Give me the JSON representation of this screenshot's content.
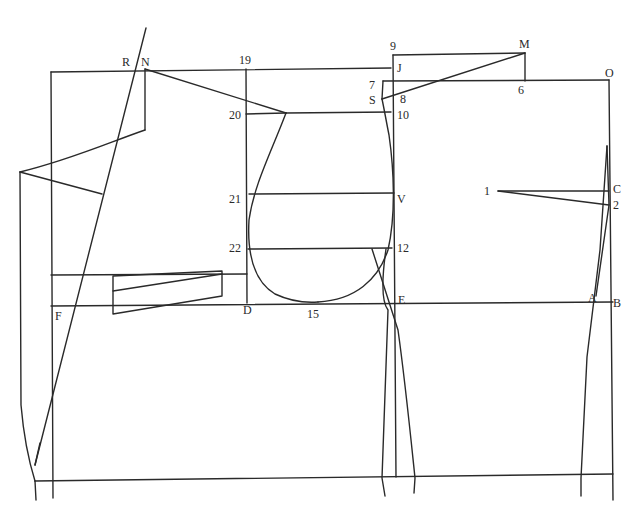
{
  "diagram": {
    "type": "garment-pattern-draft",
    "background": "#ffffff",
    "line_color": "#2a2a2a",
    "labels": [
      {
        "id": "R",
        "text": "R",
        "x": 122,
        "y": 66
      },
      {
        "id": "N",
        "text": "N",
        "x": 141,
        "y": 66
      },
      {
        "id": "19",
        "text": "19",
        "x": 239,
        "y": 64
      },
      {
        "id": "9",
        "text": "9",
        "x": 390,
        "y": 50
      },
      {
        "id": "J",
        "text": "J",
        "x": 397,
        "y": 72
      },
      {
        "id": "M",
        "text": "M",
        "x": 519,
        "y": 48
      },
      {
        "id": "O",
        "text": "O",
        "x": 605,
        "y": 77
      },
      {
        "id": "7",
        "text": "7",
        "x": 369,
        "y": 89
      },
      {
        "id": "S",
        "text": "S",
        "x": 369,
        "y": 104
      },
      {
        "id": "8",
        "text": "8",
        "x": 400,
        "y": 103
      },
      {
        "id": "6",
        "text": "6",
        "x": 518,
        "y": 94
      },
      {
        "id": "20",
        "text": "20",
        "x": 229,
        "y": 119
      },
      {
        "id": "10",
        "text": "10",
        "x": 397,
        "y": 119
      },
      {
        "id": "1",
        "text": "1",
        "x": 484,
        "y": 195
      },
      {
        "id": "C",
        "text": "C",
        "x": 613,
        "y": 193
      },
      {
        "id": "21",
        "text": "21",
        "x": 229,
        "y": 203
      },
      {
        "id": "V",
        "text": "V",
        "x": 397,
        "y": 203
      },
      {
        "id": "2",
        "text": "2",
        "x": 613,
        "y": 209
      },
      {
        "id": "22",
        "text": "22",
        "x": 229,
        "y": 252
      },
      {
        "id": "12",
        "text": "12",
        "x": 397,
        "y": 252
      },
      {
        "id": "F",
        "text": "F",
        "x": 55,
        "y": 320
      },
      {
        "id": "D",
        "text": "D",
        "x": 243,
        "y": 314
      },
      {
        "id": "15",
        "text": "15",
        "x": 307,
        "y": 318
      },
      {
        "id": "E",
        "text": "E",
        "x": 398,
        "y": 304
      },
      {
        "id": "A",
        "text": "A",
        "x": 588,
        "y": 302
      },
      {
        "id": "B",
        "text": "B",
        "x": 613,
        "y": 307
      }
    ],
    "lines": {
      "top_back_line": "M51 72 L391 68",
      "back_left_vertical": "M51 72 L53 498",
      "back_hem": "M35 481 L613 474",
      "chest_line_left": "M51 275 L247 274",
      "waist_line": "M51 306 L613 302",
      "line_19_D": "M246 69 L247 303",
      "line_20": "M246 114 L286 113",
      "line_20_10": "M286 113 L391 112",
      "line_21_V": "M249 194 L394 193",
      "line_22_12": "M248 249 L392 248",
      "center_front_vertical": "M393 55 L396 477",
      "top_9_M": "M393 55 L525 53",
      "line_7_O": "M383 81 L609 80",
      "line_M_6": "M525 53 L525 81",
      "line_M_S": "M525 53 L382 99",
      "line_7_S": "M383 81 L382 99",
      "right_vertical_O_B": "M609 80 L613 500",
      "dart_1_C": "M498 191 L609 191",
      "dart_1_2": "M498 191 L609 205",
      "lapel_N_20": "M145 69 L286 113",
      "collar_N_down": "M145 69 L145 130",
      "collar_to_left": "M145 130 C110 142, 70 160, 20 172",
      "collar_diag": "M20 172 L102 194",
      "front_left_edge": "M20 172 L21 405 C24 440, 30 465, 35 481",
      "stand_line": "M146 28 L35 465",
      "stand_line_low": "M35 481 L36 500",
      "stand_tick": "M35 465 L40 443",
      "pocket_outer": "M113 276 L113 314 L222 296 L222 271 Z",
      "pocket_inner": "M113 291 L222 274",
      "armhole_back": "M286 113 C270 155, 254 185, 249 220 C247 255, 255 282, 275 294 C290 301, 305 303, 318 302",
      "armhole_front": "M318 302 C355 300, 378 280, 388 250 C396 215, 394 170, 389 135 C386 120, 384 108, 382 99",
      "side_seam_left_a": "M372 249 L398 330 C405 380, 410 430, 415 478 L414 493",
      "side_seam_left_b": "M386 249 C383 270, 380 300, 388 310 L382 478 L385 496",
      "side_seam_right": "M607 146 L600 250 L587 357 L581 478 L581 496",
      "side_seam_right_b": "M607 146 L609 205 L596 296"
    }
  }
}
